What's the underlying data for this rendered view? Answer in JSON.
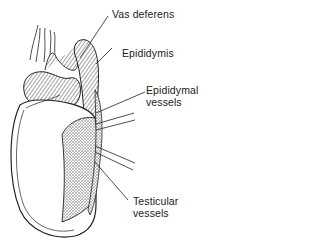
{
  "figure": {
    "type": "anatomical-illustration",
    "labels": [
      {
        "id": "vas-deferens",
        "lines": [
          "Vas deferens"
        ]
      },
      {
        "id": "epididymis",
        "lines": [
          "Epididymis"
        ]
      },
      {
        "id": "epididymal-vessels",
        "lines": [
          "Epididymal",
          "vessels"
        ]
      },
      {
        "id": "testicular-vessels",
        "lines": [
          "Testicular",
          "vessels"
        ]
      }
    ]
  },
  "colors": {
    "ink": "#222222",
    "background": "#ffffff",
    "stipple": "#9a9a9a"
  }
}
